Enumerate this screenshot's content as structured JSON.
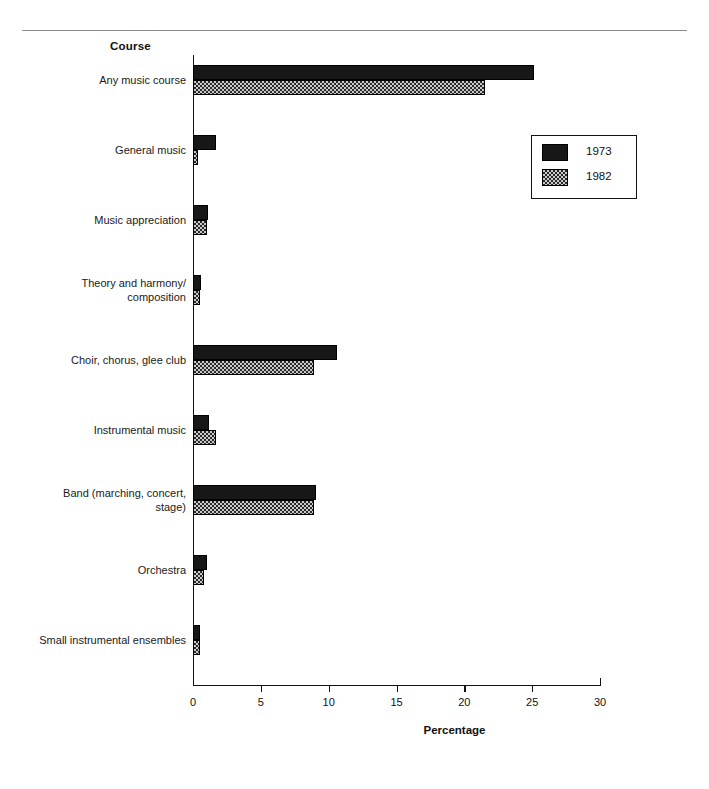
{
  "chart_data": {
    "type": "bar",
    "orientation": "horizontal",
    "title": "",
    "xlabel": "Percentage",
    "ylabel": "Course",
    "xlim": [
      0,
      30
    ],
    "xticks": [
      0,
      5,
      10,
      15,
      20,
      25,
      30
    ],
    "grid": false,
    "legend_position": "upper right",
    "categories": [
      "Any music course",
      "General music",
      "Music appreciation",
      "Theory and harmony/ composition",
      "Choir, chorus, glee club",
      "Instrumental music",
      "Band (marching, concert, stage)",
      "Orchestra",
      "Small instrumental ensembles"
    ],
    "category_lines": [
      [
        "Any music course"
      ],
      [
        "General music"
      ],
      [
        "Music appreciation"
      ],
      [
        "Theory and harmony/",
        "composition"
      ],
      [
        "Choir, chorus, glee club"
      ],
      [
        "Instrumental music"
      ],
      [
        "Band (marching, concert,",
        "stage)"
      ],
      [
        "Orchestra"
      ],
      [
        "Small instrumental ensembles"
      ]
    ],
    "series": [
      {
        "name": "1973",
        "color": "#171717",
        "pattern": "solid",
        "values": [
          25.1,
          1.7,
          1.1,
          0.6,
          10.6,
          1.2,
          9.1,
          1.0,
          0.5
        ]
      },
      {
        "name": "1982",
        "color": "#c9c9c9",
        "pattern": "checkered",
        "values": [
          21.5,
          0.4,
          1.0,
          0.5,
          8.9,
          1.7,
          8.9,
          0.8,
          0.5
        ]
      }
    ]
  },
  "legend": {
    "entries": [
      {
        "label": "1973"
      },
      {
        "label": "1982"
      }
    ]
  }
}
